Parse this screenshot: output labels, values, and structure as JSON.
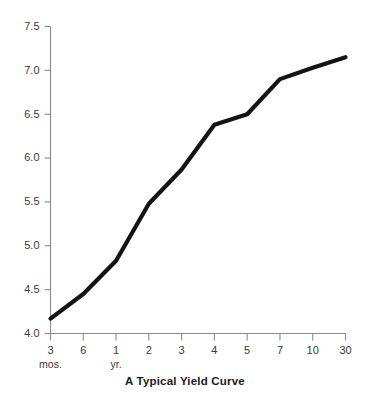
{
  "chart_data": {
    "type": "line",
    "title": "A Typical Yield Curve",
    "xlabel": "",
    "ylabel": "",
    "grid": false,
    "legend": false,
    "categories": [
      "3",
      "6",
      "1",
      "2",
      "3",
      "4",
      "5",
      "7",
      "10",
      "30"
    ],
    "category_units": [
      "mos.",
      "mos.",
      "yr.",
      "yr.",
      "yr.",
      "yr.",
      "yr.",
      "yr.",
      "yr.",
      "yr."
    ],
    "unit_annotations": [
      {
        "index": 0,
        "text": "mos."
      },
      {
        "index": 2,
        "text": "yr."
      }
    ],
    "values": [
      4.17,
      4.45,
      4.83,
      5.48,
      5.87,
      6.38,
      6.5,
      6.9,
      7.03,
      7.15
    ],
    "series": [
      {
        "name": "Yield",
        "values": [
          4.17,
          4.45,
          4.83,
          5.48,
          5.87,
          6.38,
          6.5,
          6.9,
          7.03,
          7.15
        ]
      }
    ],
    "ylim": [
      4.0,
      7.5
    ],
    "yticks": [
      4.0,
      4.5,
      5.0,
      5.5,
      6.0,
      6.5,
      7.0,
      7.5
    ],
    "ytick_labels": [
      "4.0",
      "4.5",
      "5.0",
      "5.5",
      "6.0",
      "6.5",
      "7.0",
      "7.5"
    ],
    "xtick_labels": [
      "3",
      "6",
      "1",
      "2",
      "3",
      "4",
      "5",
      "7",
      "10",
      "30"
    ],
    "line_color": "#141414",
    "axis_color": "#8a8a8a",
    "background_color": "#ffffff"
  },
  "axes": {
    "y_axis_name": "yield-percent-axis",
    "x_axis_name": "maturity-axis"
  }
}
